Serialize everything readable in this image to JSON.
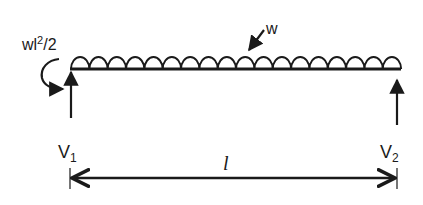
{
  "diagram": {
    "type": "cantilever-beam-udl",
    "colors": {
      "stroke": "#1a1a1a",
      "background": "#ffffff"
    },
    "labels": {
      "moment": {
        "base": "wl",
        "sup": "2",
        "rest": "/2"
      },
      "load": "w",
      "reaction_left": {
        "base": "V",
        "sub": "1"
      },
      "reaction_right": {
        "base": "V",
        "sub": "2"
      },
      "span": "l"
    },
    "load": {
      "kind": "uniformly-distributed",
      "loop_count": 18
    }
  }
}
